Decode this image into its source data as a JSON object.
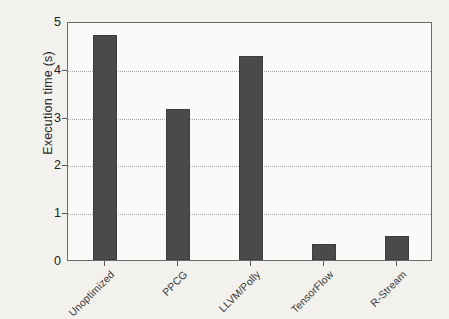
{
  "chart_data": {
    "type": "bar",
    "title": "",
    "subtitle": "",
    "xlabel": "",
    "ylabel": "Execution time (s)",
    "categories": [
      "Unoptimized",
      "PPCG",
      "LLVM/Polly",
      "TensorFlow",
      "R-Stream"
    ],
    "values": [
      4.71,
      3.16,
      4.27,
      0.34,
      0.5
    ],
    "ylim": [
      0,
      5
    ],
    "yticks": [
      0,
      1,
      2,
      3,
      4,
      5
    ],
    "ytick_labels": [
      "0",
      "1",
      "2",
      "3",
      "4",
      "5"
    ],
    "gridlines": [
      1,
      2,
      3,
      4
    ],
    "grid": true,
    "legend": null,
    "legend_position": "none",
    "bar_color": "#4a4a4a",
    "axis_color": "#6a6a6a",
    "grid_color": "#a8a8a8",
    "background_color": "#f2f1ee",
    "plot_background_color": "#fbfaf8",
    "annotations": []
  }
}
